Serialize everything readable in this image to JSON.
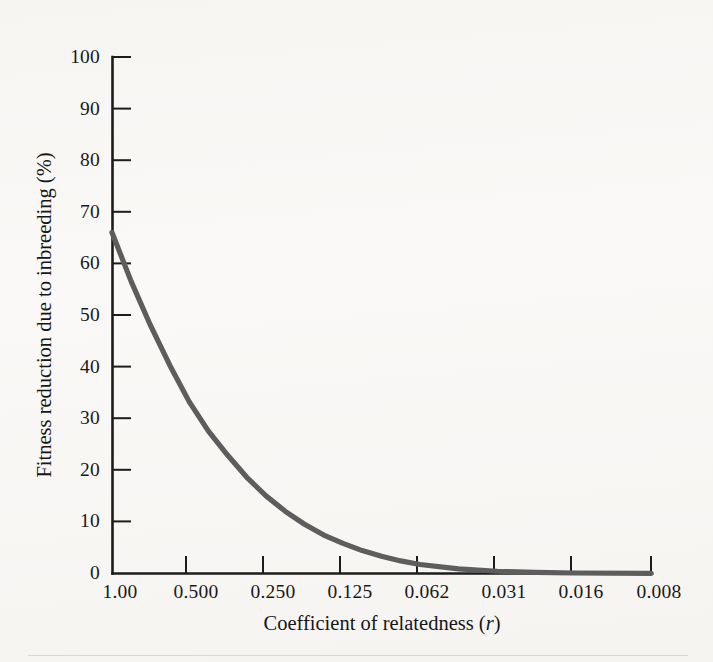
{
  "figure": {
    "background_color": "#f8f7f5",
    "axis_color": "#1c1c1c",
    "curve_color": "#5d5d5d"
  },
  "chart_data": {
    "type": "line",
    "title": "",
    "subtitle": "",
    "xlabel": "Coefficient of relatedness (r)",
    "xlabel_plain": "Coefficient of relatedness",
    "xlabel_italic_symbol": "r",
    "ylabel": "Fitness reduction due to inbreeding (%)",
    "grid": false,
    "legend": "none",
    "x_scale": "ordinal-halving",
    "x_tick_labels": [
      "1.00",
      "0.500",
      "0.250",
      "0.125",
      "0.062",
      "0.031",
      "0.016",
      "0.008"
    ],
    "x_tick_values": [
      1.0,
      0.5,
      0.25,
      0.125,
      0.062,
      0.031,
      0.016,
      0.008
    ],
    "y_tick_labels": [
      "0",
      "10",
      "20",
      "30",
      "40",
      "50",
      "60",
      "70",
      "80",
      "90",
      "100"
    ],
    "y_tick_values": [
      0,
      10,
      20,
      30,
      40,
      50,
      60,
      70,
      80,
      90,
      100
    ],
    "ylim": [
      0,
      100
    ],
    "series": [
      {
        "name": "Fitness reduction",
        "x": [
          1.0,
          0.5,
          0.25,
          0.125,
          0.062,
          0.031,
          0.016,
          0.008
        ],
        "values": [
          66,
          40,
          23,
          12,
          6,
          2.6,
          0.9,
          0.2
        ]
      }
    ],
    "curve_points_normalized": [
      [
        0.0,
        66.0
      ],
      [
        0.25,
        56.5
      ],
      [
        0.5,
        48.0
      ],
      [
        0.75,
        40.3
      ],
      [
        1.0,
        33.3
      ],
      [
        1.25,
        27.6
      ],
      [
        1.5,
        22.9
      ],
      [
        1.75,
        18.6
      ],
      [
        2.0,
        15.0
      ],
      [
        2.25,
        12.0
      ],
      [
        2.5,
        9.5
      ],
      [
        2.75,
        7.4
      ],
      [
        3.0,
        5.8
      ],
      [
        3.25,
        4.4
      ],
      [
        3.5,
        3.3
      ],
      [
        3.75,
        2.4
      ],
      [
        4.0,
        1.7
      ],
      [
        4.5,
        0.85
      ],
      [
        5.0,
        0.4
      ],
      [
        5.5,
        0.18
      ],
      [
        6.0,
        0.06
      ],
      [
        7.0,
        0.0
      ]
    ]
  }
}
